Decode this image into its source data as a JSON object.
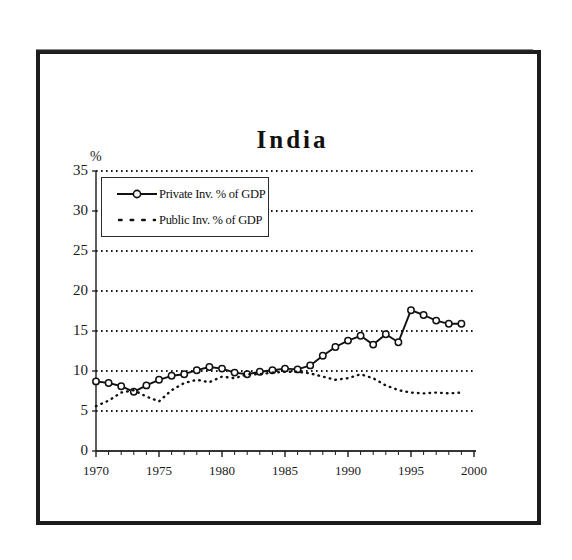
{
  "figure": {
    "title": "India",
    "y_axis_unit": "%"
  },
  "legend": {
    "items": [
      {
        "label": "Private Inv. % of GDP",
        "style": "solid-line-with-open-circle-markers",
        "color": "#111111"
      },
      {
        "label": "Public Inv. % of GDP",
        "style": "dotted-line",
        "color": "#111111"
      }
    ]
  },
  "chart_data": {
    "type": "line",
    "title": "India",
    "subtitle": "",
    "xlabel": "",
    "ylabel": "%",
    "xlim": [
      1970,
      2000
    ],
    "ylim": [
      0,
      35
    ],
    "ytick_labels": [
      "0",
      "5",
      "10",
      "15",
      "20",
      "25",
      "30",
      "35"
    ],
    "yticks": [
      0,
      5,
      10,
      15,
      20,
      25,
      30,
      35
    ],
    "xtick_labels": [
      "1970",
      "1975",
      "1980",
      "1985",
      "1990",
      "1995",
      "2000"
    ],
    "xticks": [
      1970,
      1975,
      1980,
      1985,
      1990,
      1995,
      2000
    ],
    "grid": "horizontal-dotted",
    "legend_position": "upper-left-inside",
    "x": [
      1970,
      1971,
      1972,
      1973,
      1974,
      1975,
      1976,
      1977,
      1978,
      1979,
      1980,
      1981,
      1982,
      1983,
      1984,
      1985,
      1986,
      1987,
      1988,
      1989,
      1990,
      1991,
      1992,
      1993,
      1994,
      1995,
      1996,
      1997,
      1998,
      1999
    ],
    "series": [
      {
        "name": "Private Inv. % of GDP",
        "marker": "open-circle",
        "linestyle": "solid",
        "values": [
          8.7,
          8.5,
          8.1,
          7.4,
          8.2,
          8.9,
          9.4,
          9.6,
          10.1,
          10.5,
          10.3,
          9.8,
          9.6,
          9.9,
          10.1,
          10.3,
          10.2,
          10.7,
          11.9,
          13.0,
          13.8,
          14.4,
          13.3,
          14.6,
          13.6,
          17.6,
          17.0,
          16.3,
          15.9,
          15.9
        ]
      },
      {
        "name": "Public Inv. % of GDP",
        "marker": "none",
        "linestyle": "dotted",
        "values": [
          5.6,
          6.3,
          7.3,
          7.6,
          6.8,
          6.2,
          7.6,
          8.5,
          8.9,
          8.6,
          9.3,
          9.1,
          9.6,
          9.6,
          9.8,
          9.9,
          9.9,
          9.7,
          9.3,
          8.9,
          9.1,
          9.6,
          9.1,
          8.2,
          7.6,
          7.3,
          7.2,
          7.3,
          7.2,
          7.3
        ]
      }
    ]
  }
}
